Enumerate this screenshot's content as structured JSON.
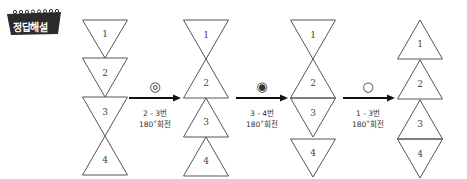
{
  "badge": {
    "label": "정답해설",
    "color": "#2b2b2b"
  },
  "colors": {
    "stroke": "#555555",
    "arrow": "#111111"
  },
  "columns": [
    {
      "center_x": 105,
      "pieces": [
        {
          "number": "1",
          "orientation": "down",
          "top": 20,
          "bottom": 58
        },
        {
          "number": "2",
          "orientation": "down",
          "top": 58,
          "bottom": 97
        },
        {
          "number": "3",
          "orientation": "down",
          "top": 97,
          "bottom": 136
        },
        {
          "number": "4",
          "orientation": "up",
          "top": 136,
          "bottom": 175
        }
      ]
    },
    {
      "center_x": 206,
      "pieces": [
        {
          "number": "1",
          "orientation": "down",
          "top": 20,
          "bottom": 59
        },
        {
          "number": "2",
          "orientation": "up",
          "top": 59,
          "bottom": 98
        },
        {
          "number": "3",
          "orientation": "up",
          "top": 98,
          "bottom": 137
        },
        {
          "number": "4",
          "orientation": "up",
          "top": 137,
          "bottom": 176
        }
      ]
    },
    {
      "center_x": 313,
      "pieces": [
        {
          "number": "1",
          "orientation": "down",
          "top": 20,
          "bottom": 59
        },
        {
          "number": "2",
          "orientation": "up",
          "top": 59,
          "bottom": 98
        },
        {
          "number": "3",
          "orientation": "down",
          "top": 98,
          "bottom": 137
        },
        {
          "number": "4",
          "orientation": "down",
          "top": 139,
          "bottom": 177
        }
      ]
    },
    {
      "center_x": 420,
      "pieces": [
        {
          "number": "1",
          "orientation": "up",
          "top": 20,
          "bottom": 59
        },
        {
          "number": "2",
          "orientation": "up",
          "top": 60,
          "bottom": 99
        },
        {
          "number": "3",
          "orientation": "up",
          "top": 100,
          "bottom": 139
        },
        {
          "number": "4",
          "orientation": "down",
          "top": 139,
          "bottom": 178
        }
      ]
    }
  ],
  "steps": [
    {
      "symbol": "◎",
      "symbol_name": "double-circle",
      "caption_line1": "2 - 3번",
      "caption_line2": "180˚회전",
      "x1": 129,
      "x2": 181,
      "symbol_x": 155,
      "y": 98
    },
    {
      "symbol": "◉",
      "symbol_name": "filled-circle",
      "caption_line1": "3 - 4번",
      "caption_line2": "180˚회전",
      "x1": 236,
      "x2": 288,
      "symbol_x": 262,
      "y": 98
    },
    {
      "symbol": "○",
      "symbol_name": "empty-circle",
      "caption_line1": "1 - 3번",
      "caption_line2": "180˚회전",
      "x1": 343,
      "x2": 395,
      "symbol_x": 368,
      "y": 98
    }
  ]
}
